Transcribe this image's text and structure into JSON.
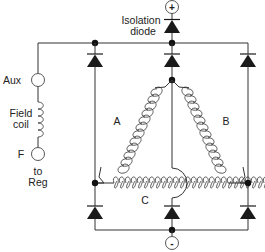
{
  "diagram": {
    "terminals": {
      "positive": "+",
      "negative": "-",
      "aux": "Aux",
      "field": "F"
    },
    "labels": {
      "isolation_line1": "Isolation",
      "isolation_line2": "diode",
      "field_line1": "Field",
      "field_line2": "coil",
      "to_reg_line1": "to",
      "to_reg_line2": "Reg",
      "winding_a": "A",
      "winding_b": "B",
      "winding_c": "C"
    },
    "components": [
      {
        "type": "isolation-diode",
        "count": 1
      },
      {
        "type": "positive-rectifier-diodes",
        "count": 3
      },
      {
        "type": "negative-rectifier-diodes",
        "count": 3
      },
      {
        "type": "stator-windings",
        "configuration": "delta",
        "names": [
          "A",
          "B",
          "C"
        ]
      },
      {
        "type": "field-coil",
        "count": 1
      }
    ],
    "colors": {
      "line": "#333333",
      "fill": "#1a1a1a",
      "background": "#ffffff"
    }
  }
}
